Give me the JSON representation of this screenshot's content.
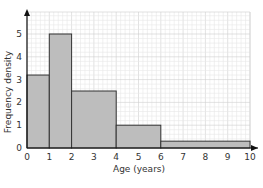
{
  "chart_data": {
    "type": "bar",
    "subtype": "histogram",
    "title": "",
    "xlabel": "Age (years)",
    "ylabel": "Frequency density",
    "xlim": [
      0,
      10
    ],
    "ylim": [
      0,
      5.5
    ],
    "x_ticks": [
      0,
      1,
      2,
      3,
      4,
      5,
      6,
      7,
      8,
      9,
      10
    ],
    "y_ticks": [
      0,
      1,
      2,
      3,
      4,
      5
    ],
    "grid": true,
    "bins": [
      {
        "from": 0,
        "to": 1,
        "value": 3.2
      },
      {
        "from": 1,
        "to": 2,
        "value": 5
      },
      {
        "from": 2,
        "to": 4,
        "value": 2.5
      },
      {
        "from": 4,
        "to": 6,
        "value": 1
      },
      {
        "from": 6,
        "to": 10,
        "value": 0.3
      }
    ],
    "categories": [
      "0-1",
      "1-2",
      "2-4",
      "4-6",
      "6-10"
    ],
    "values": [
      3.2,
      5,
      2.5,
      1,
      0.3
    ],
    "colors": {
      "bar_fill": "#bdbdbd",
      "bar_stroke": "#333333",
      "grid_minor": "#e8e8e8",
      "grid_major": "#cfcfcf",
      "axis": "#111111"
    }
  }
}
